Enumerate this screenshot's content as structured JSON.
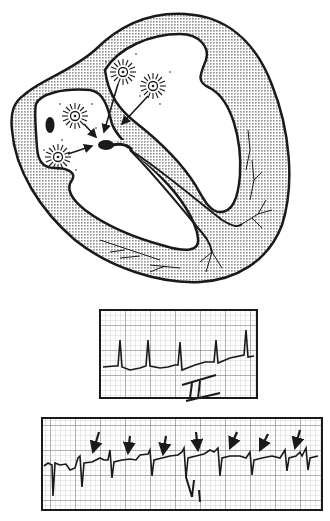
{
  "figure": {
    "heart": {
      "structures": [
        "myocardium",
        "left-atrium",
        "right-atrium",
        "atrioventricular-node",
        "bundle-of-his",
        "bundle-branches",
        "purkinje-fibers",
        "sinoatrial-node"
      ],
      "ectopic_foci_count": 4,
      "arrows_to_av_node": 4
    },
    "strip_lead_ii": {
      "label": "II",
      "beats": 5
    },
    "strip_lead_v1": {
      "label": "V",
      "label_subscript": "1",
      "beats": 8,
      "p_wave_arrows": 7
    },
    "colors": {
      "ink": "#1a1a1a",
      "stipple": "#9a9a9a",
      "grid": "#8a8a8a",
      "paper": "#ffffff"
    }
  }
}
